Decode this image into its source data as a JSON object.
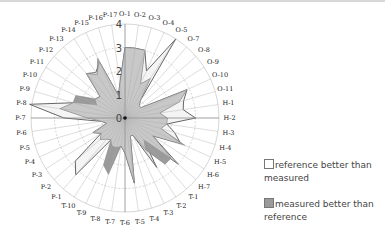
{
  "chart_data": {
    "type": "radar",
    "title": "",
    "center_label": "0",
    "radial_ticks": [
      0,
      1,
      2,
      3,
      4
    ],
    "rlim": [
      0,
      4
    ],
    "grid": true,
    "legend_position": "right",
    "categories": [
      "O-1",
      "O-2",
      "O-3",
      "O-4",
      "O-5",
      "O-7",
      "O-8",
      "O-9",
      "O-10",
      "O-11",
      "H-1",
      "H-2",
      "H-3",
      "H-4",
      "H-5",
      "H-6",
      "H-7",
      "T-1",
      "T-2",
      "T-3",
      "T-4",
      "T-5",
      "T-6",
      "T-7",
      "T-8",
      "T-9",
      "T-10",
      "P-1",
      "P-2",
      "P-3",
      "P-4",
      "P-5",
      "P-6",
      "P-7",
      "P-8",
      "P-9",
      "P-10",
      "P-11",
      "P-12",
      "P-13",
      "P-14",
      "P-15",
      "P-16",
      "P-17"
    ],
    "series": [
      {
        "name": "reference",
        "values": [
          3.0,
          3.0,
          3.0,
          2.2,
          4.0,
          1.0,
          0.8,
          0.8,
          2.9,
          2.6,
          2.5,
          3.0,
          1.8,
          2.2,
          2.6,
          1.4,
          3.0,
          1.2,
          2.5,
          0.8,
          0.8,
          2.8,
          1.5,
          1.2,
          1.3,
          1.3,
          1.1,
          3.2,
          2.8,
          1.2,
          1.5,
          0.8,
          1.0,
          2.6,
          4.1,
          2.3,
          1.3,
          1.5,
          1.4,
          2.5,
          2.3,
          2.6,
          1.0,
          1.5
        ]
      },
      {
        "name": "measured",
        "values": [
          3.0,
          3.0,
          3.0,
          1.6,
          2.0,
          1.0,
          0.8,
          0.8,
          2.9,
          2.4,
          1.5,
          1.8,
          1.8,
          1.6,
          2.8,
          1.4,
          2.6,
          2.6,
          1.6,
          0.8,
          0.8,
          2.8,
          1.5,
          1.2,
          2.5,
          2.2,
          1.1,
          1.2,
          1.4,
          1.2,
          1.5,
          0.8,
          1.0,
          1.6,
          2.8,
          2.3,
          2.3,
          1.5,
          1.4,
          2.5,
          2.2,
          2.8,
          1.0,
          1.5
        ]
      }
    ],
    "legend": [
      {
        "label": "reference better than measured",
        "color": "#ffffff"
      },
      {
        "label": "measured better than reference",
        "color": "#9a9a9a"
      }
    ],
    "colors": {
      "reference_fill": "#f2f2f2",
      "measured_fill": "#c8c8c8",
      "measured_better": "#9a9a9a",
      "outline": "#555555",
      "grid": "#bbbbbb"
    }
  },
  "legend": {
    "item1": {
      "line1": "reference better than",
      "line2": "measured"
    },
    "item2": {
      "line1": "measured better than",
      "line2": "reference"
    }
  }
}
